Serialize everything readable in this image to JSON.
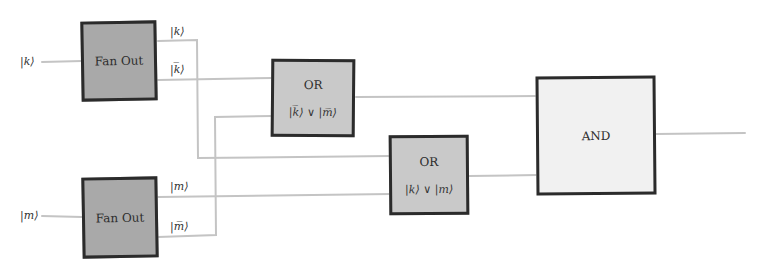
{
  "diagram": {
    "type": "logic-circuit",
    "inputs": [
      {
        "id": "k",
        "label": "|k⟩"
      },
      {
        "id": "m",
        "label": "|m⟩"
      }
    ],
    "gates": {
      "fanout_k": {
        "title": "Fan Out",
        "outputs": [
          "|k⟩",
          "|k̅⟩"
        ]
      },
      "fanout_m": {
        "title": "Fan Out",
        "outputs": [
          "|m⟩",
          "|m̅⟩"
        ]
      },
      "or1": {
        "title": "OR",
        "expression": "|k̅⟩ ∨ |m̅⟩"
      },
      "or2": {
        "title": "OR",
        "expression": "|k⟩ ∨ |m⟩"
      },
      "and": {
        "title": "AND"
      }
    },
    "wire_labels": {
      "k_out": "|k⟩",
      "kbar_out": "|k̅⟩",
      "m_out": "|m⟩",
      "mbar_out": "|m̅⟩"
    },
    "connections": [
      {
        "from": "input k",
        "to": "fanout_k"
      },
      {
        "from": "input m",
        "to": "fanout_m"
      },
      {
        "from": "fanout_k |k⟩",
        "to": "or2"
      },
      {
        "from": "fanout_k |k̅⟩",
        "to": "or1"
      },
      {
        "from": "fanout_m |m⟩",
        "to": "or2"
      },
      {
        "from": "fanout_m |m̅⟩",
        "to": "or1"
      },
      {
        "from": "or1",
        "to": "and"
      },
      {
        "from": "or2",
        "to": "and"
      },
      {
        "from": "and",
        "to": "output"
      }
    ],
    "colors": {
      "fanout_fill": "#a9a9a9",
      "or_fill": "#c9c9c9",
      "and_fill": "#f1f1f1",
      "border": "#2b2b2b",
      "wire": "#c4c4c4"
    }
  }
}
